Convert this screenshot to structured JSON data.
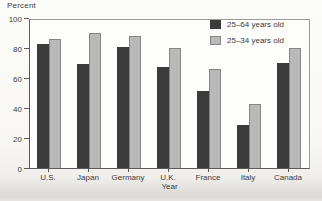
{
  "chart_data": {
    "type": "bar",
    "title": "",
    "ylabel": "Percent",
    "xlabel": "Year",
    "categories": [
      "U.S.",
      "Japan",
      "Germany",
      "U.K.",
      "France",
      "Italy",
      "Canada"
    ],
    "series": [
      {
        "name": "25–64 years old",
        "color": "#3b3b3b",
        "values": [
          84,
          70,
          82,
          68,
          52,
          29,
          71
        ]
      },
      {
        "name": "25–34 years old",
        "color": "#b9b9b9",
        "values": [
          87,
          91,
          89,
          81,
          67,
          43,
          81
        ]
      }
    ],
    "ylim": [
      0,
      100
    ],
    "yticks": [
      0,
      20,
      40,
      60,
      80,
      100
    ],
    "grid": false,
    "legend_position": "top-right-inside",
    "plot_background": "#fdfdfc",
    "paper_background": "#f8f7f4"
  },
  "layout_labels": {
    "y_axis_title": "Percent",
    "x_axis_title": "Year"
  }
}
